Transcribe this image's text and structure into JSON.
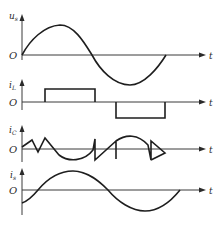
{
  "figure": {
    "colors": {
      "line": "#1e1e1e",
      "axis": "#3a3a3a",
      "background": "#ffffff"
    },
    "panels": [
      {
        "id": "us",
        "y_label": "u",
        "y_sub": "s",
        "origin_label": "O",
        "x_label": "t",
        "waveform": "sine"
      },
      {
        "id": "iL",
        "y_label": "i",
        "y_sub": "L",
        "origin_label": "O",
        "x_label": "t",
        "waveform": "rectangular pulses (positive then negative)"
      },
      {
        "id": "iC",
        "y_label": "i",
        "y_sub": "C",
        "origin_label": "O",
        "x_label": "t",
        "waveform": "sawtooth ripple with sinusoidal arcs"
      },
      {
        "id": "is",
        "y_label": "i",
        "y_sub": "s",
        "origin_label": "O",
        "x_label": "t",
        "waveform": "phase-shifted sine"
      }
    ]
  }
}
